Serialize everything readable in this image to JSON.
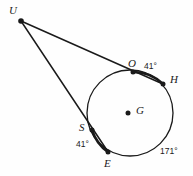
{
  "figure": {
    "kind": "circle-secant-diagram",
    "stroke_color": "#1a1a1a",
    "fill_color": "#ffffff",
    "background": "#fefefe",
    "width": 193,
    "height": 176
  },
  "circle": {
    "center_label": "G",
    "center_x": 130,
    "center_y": 113,
    "radius": 43
  },
  "points": [
    {
      "id": "U",
      "label": "U",
      "x": 21,
      "y": 21,
      "label_x": 9,
      "label_y": 5,
      "role": "external-vertex"
    },
    {
      "id": "O",
      "label": "O",
      "x": 133,
      "y": 72,
      "label_x": 128,
      "label_y": 58,
      "role": "on-circle"
    },
    {
      "id": "H",
      "label": "H",
      "x": 163,
      "y": 84,
      "label_x": 170,
      "label_y": 74,
      "role": "on-circle"
    },
    {
      "id": "S",
      "label": "S",
      "x": 92,
      "y": 130,
      "label_x": 79,
      "label_y": 122,
      "role": "on-circle"
    },
    {
      "id": "E",
      "label": "E",
      "x": 108,
      "y": 152,
      "label_x": 104,
      "label_y": 158,
      "role": "on-circle"
    },
    {
      "id": "G",
      "label": "G",
      "x": 128,
      "y": 113,
      "label_x": 136,
      "label_y": 105,
      "role": "center"
    }
  ],
  "secants": [
    {
      "id": "UOH",
      "from": "U",
      "through": "O",
      "to": "H"
    },
    {
      "id": "USE",
      "from": "U",
      "through": "S",
      "to": "E"
    }
  ],
  "highlighted_arcs": [
    {
      "id": "arc-OH",
      "from": "O",
      "to": "H",
      "measure": "41°"
    },
    {
      "id": "arc-SE",
      "from": "S",
      "to": "E",
      "measure": "41°"
    }
  ],
  "arc_labels": [
    {
      "id": "arc-OH-measure",
      "text": "41°",
      "x": 144,
      "y": 62
    },
    {
      "id": "arc-SE-measure",
      "text": "41°",
      "x": 76,
      "y": 140
    },
    {
      "id": "arc-EH-measure",
      "text": "171°",
      "x": 160,
      "y": 147
    }
  ]
}
